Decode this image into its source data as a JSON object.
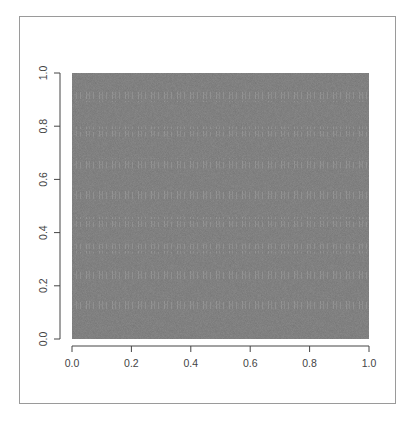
{
  "chart_data": {
    "type": "heatmap",
    "title": "",
    "xlabel": "",
    "ylabel": "",
    "xlim": [
      0.0,
      1.0
    ],
    "ylim": [
      0.0,
      1.0
    ],
    "x_ticks": [
      "0.0",
      "0.2",
      "0.4",
      "0.6",
      "0.8",
      "1.0"
    ],
    "y_ticks": [
      "0.0",
      "0.2",
      "0.4",
      "0.6",
      "0.8",
      "1.0"
    ],
    "grid": false,
    "legend": null,
    "fill_color": "#757575",
    "glyph_row_y_positions": [
      0.91,
      0.78,
      0.66,
      0.54,
      0.44,
      0.34,
      0.24,
      0.13
    ]
  },
  "axes": {
    "x": {
      "ticks": [
        "0.0",
        "0.2",
        "0.4",
        "0.6",
        "0.8",
        "1.0"
      ]
    },
    "y": {
      "ticks": [
        "0.0",
        "0.2",
        "0.4",
        "0.6",
        "0.8",
        "1.0"
      ]
    }
  },
  "colors": {
    "raster": "#757575",
    "axis": "#444444",
    "frame": "#9a9a9a"
  }
}
